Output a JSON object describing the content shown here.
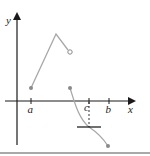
{
  "figure": {
    "axis_labels": {
      "x": "x",
      "y": "y"
    },
    "tick_labels": {
      "a": "a",
      "c": "c",
      "b": "b"
    },
    "colors": {
      "axis": "#1a1a1a",
      "curve": "#a8a8a8",
      "point": "#8a8a8a",
      "tangent": "#222222",
      "border": "#555555"
    }
  }
}
